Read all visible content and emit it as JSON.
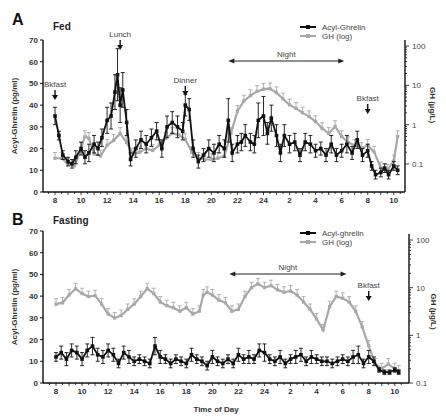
{
  "chart_data": [
    {
      "panel": "A",
      "title": "Fed",
      "type": "line",
      "xlabel": "",
      "ylabel": "Acyl-Ghrelin (pg/ml)",
      "y2label": "GH (µg/L)",
      "ylim": [
        0,
        70
      ],
      "y2lim_log": [
        0.1,
        100
      ],
      "yticks": [
        "0",
        "10",
        "20",
        "30",
        "40",
        "50",
        "60",
        "70"
      ],
      "y2ticks": [
        "0.1",
        "1",
        "10",
        "100"
      ],
      "xticks": [
        "8",
        "10",
        "12",
        "14",
        "16",
        "18",
        "20",
        "22",
        "24",
        "2",
        "4",
        "6",
        "8",
        "10"
      ],
      "legend": [
        {
          "name": "Acyl-Ghrelin",
          "color": "#111111"
        },
        {
          "name": "GH (log)",
          "color": "#a8a8a8"
        }
      ],
      "annotations": [
        {
          "text": "Bkfast",
          "hour": 8
        },
        {
          "text": "Lunch",
          "hour": 13
        },
        {
          "text": "Dinner",
          "hour": 18
        },
        {
          "text": "Bkfast",
          "hour": 32
        }
      ],
      "night": {
        "label": "Night",
        "from": 21.3,
        "to": 30.2
      },
      "series": [
        {
          "name": "Acyl-Ghrelin",
          "hours": [
            8,
            8.3,
            8.6,
            9,
            9.3,
            9.6,
            10,
            10.3,
            10.6,
            11,
            11.3,
            11.6,
            12,
            12.3,
            12.6,
            12.8,
            13,
            13.2,
            13.5,
            13.8,
            14.2,
            14.6,
            15,
            15.4,
            15.8,
            16.2,
            16.6,
            17,
            17.4,
            17.8,
            18,
            18.3,
            18.6,
            19,
            19.4,
            19.8,
            20.2,
            20.6,
            21,
            21.3,
            21.6,
            22,
            22.3,
            22.6,
            23,
            23.3,
            23.6,
            24,
            24.3,
            24.6,
            25,
            25.3,
            25.6,
            26,
            26.4,
            26.8,
            27.2,
            27.6,
            28,
            28.4,
            28.8,
            29.2,
            29.6,
            30,
            30.4,
            30.8,
            31.2,
            31.6,
            32,
            32.3,
            32.6,
            33,
            33.3,
            33.6,
            34,
            34.3
          ],
          "values": [
            35,
            26,
            17,
            14,
            13,
            16,
            20,
            16,
            18,
            22,
            20,
            25,
            33,
            35,
            46,
            54,
            40,
            47,
            32,
            15,
            20,
            24,
            22,
            25,
            28,
            20,
            30,
            32,
            30,
            28,
            40,
            38,
            20,
            14,
            17,
            20,
            18,
            22,
            20,
            33,
            18,
            22,
            23,
            26,
            23,
            22,
            33,
            35,
            27,
            34,
            26,
            18,
            26,
            22,
            23,
            17,
            23,
            22,
            19,
            20,
            17,
            22,
            17,
            19,
            22,
            18,
            24,
            17,
            19,
            12,
            8,
            9,
            11,
            8,
            12,
            10
          ],
          "err": [
            4,
            2,
            2,
            2,
            2,
            3,
            3,
            3,
            4,
            4,
            3,
            4,
            6,
            6,
            8,
            12,
            8,
            8,
            6,
            3,
            4,
            4,
            4,
            4,
            4,
            4,
            5,
            5,
            5,
            4,
            5,
            5,
            4,
            3,
            3,
            4,
            4,
            4,
            4,
            10,
            4,
            4,
            4,
            5,
            4,
            4,
            8,
            9,
            5,
            6,
            5,
            4,
            5,
            4,
            4,
            3,
            4,
            4,
            3,
            3,
            3,
            4,
            3,
            3,
            4,
            3,
            4,
            3,
            3,
            2,
            2,
            2,
            2,
            2,
            2,
            2
          ]
        },
        {
          "name": "GH (log)",
          "hours": [
            8,
            8.5,
            9,
            9.5,
            10,
            10.3,
            10.6,
            11,
            11.5,
            12,
            12.5,
            13,
            13.5,
            14,
            14.5,
            15,
            15.5,
            16,
            16.5,
            17,
            17.5,
            18,
            18.5,
            19,
            19.5,
            20,
            20.5,
            21,
            21.5,
            22,
            22.5,
            23,
            23.5,
            24,
            24.5,
            25,
            25.5,
            26,
            26.5,
            27,
            27.5,
            28,
            28.5,
            29,
            29.5,
            30,
            30.5,
            31,
            31.5,
            32,
            32.5,
            33,
            33.5,
            34,
            34.3
          ],
          "values": [
            0.14,
            0.14,
            0.1,
            0.09,
            0.25,
            0.5,
            0.45,
            0.18,
            0.16,
            0.3,
            0.4,
            0.6,
            0.35,
            0.18,
            0.2,
            0.25,
            0.22,
            0.3,
            0.45,
            0.6,
            0.55,
            0.42,
            0.2,
            0.14,
            0.13,
            0.13,
            0.14,
            0.16,
            0.6,
            2.2,
            4,
            5.5,
            7,
            8,
            8.2,
            6.5,
            4.5,
            3.2,
            2.6,
            2,
            1.6,
            1.2,
            0.8,
            0.6,
            0.9,
            0.5,
            0.35,
            0.3,
            0.25,
            0.3,
            0.2,
            0.08,
            0.07,
            0.12,
            0.5
          ],
          "err_factor": 1.4
        }
      ]
    },
    {
      "panel": "B",
      "title": "Fasting",
      "type": "line",
      "xlabel": "Time of Day",
      "ylabel": "Acyl-Ghrelin (pg/ml)",
      "y2label": "GH (µg/L)",
      "ylim": [
        0,
        70
      ],
      "y2lim_log": [
        0.1,
        100
      ],
      "yticks": [
        "0",
        "10",
        "20",
        "30",
        "40",
        "50",
        "60",
        "70"
      ],
      "y2ticks": [
        "0.1",
        "1",
        "10",
        "100"
      ],
      "xticks": [
        "8",
        "10",
        "12",
        "14",
        "16",
        "18",
        "20",
        "22",
        "24",
        "2",
        "4",
        "6",
        "8",
        "10"
      ],
      "legend": [
        {
          "name": "Acyl-ghrelin",
          "color": "#111111"
        },
        {
          "name": "GH (log)",
          "color": "#a8a8a8"
        }
      ],
      "annotations": [
        {
          "text": "Bkfast",
          "hour": 32
        }
      ],
      "night": {
        "label": "Night",
        "from": 21.3,
        "to": 30.3
      },
      "series": [
        {
          "name": "Acyl-ghrelin",
          "hours": [
            8,
            8.4,
            8.8,
            9.2,
            9.6,
            10,
            10.4,
            10.8,
            11.2,
            11.6,
            12,
            12.4,
            12.8,
            13.2,
            13.6,
            14,
            14.4,
            14.8,
            15.2,
            15.6,
            16,
            16.4,
            16.8,
            17.2,
            17.6,
            18,
            18.4,
            18.8,
            19.2,
            19.6,
            20,
            20.4,
            20.8,
            21.2,
            21.6,
            22,
            22.4,
            22.8,
            23.2,
            23.6,
            24,
            24.4,
            24.8,
            25.2,
            25.6,
            26,
            26.4,
            26.8,
            27.2,
            27.6,
            28,
            28.4,
            28.8,
            29.2,
            29.6,
            30,
            30.4,
            30.8,
            31.2,
            31.6,
            32,
            32.4,
            32.8,
            33.2,
            33.6,
            34,
            34.3
          ],
          "values": [
            12,
            14,
            11,
            15,
            14,
            11,
            15,
            17,
            13,
            12,
            15,
            13,
            9,
            14,
            12,
            10,
            11,
            10,
            9,
            17,
            12,
            11,
            9,
            11,
            10,
            9,
            13,
            11,
            10,
            8,
            12,
            10,
            9,
            11,
            9,
            13,
            11,
            12,
            11,
            15,
            14,
            11,
            10,
            12,
            9,
            11,
            12,
            13,
            10,
            12,
            11,
            10,
            10,
            9,
            10,
            11,
            10,
            12,
            13,
            9,
            12,
            10,
            6,
            5,
            5,
            6,
            5
          ],
          "err": [
            2,
            3,
            3,
            3,
            3,
            3,
            3,
            4,
            3,
            3,
            3,
            3,
            2,
            3,
            3,
            2,
            2,
            2,
            2,
            4,
            3,
            2,
            2,
            2,
            2,
            2,
            3,
            2,
            2,
            2,
            3,
            2,
            2,
            2,
            2,
            3,
            2,
            3,
            2,
            3,
            4,
            2,
            2,
            3,
            2,
            2,
            3,
            3,
            2,
            3,
            2,
            2,
            2,
            2,
            2,
            2,
            2,
            3,
            4,
            2,
            3,
            2,
            1,
            1,
            1,
            1,
            1
          ]
        },
        {
          "name": "GH (log)",
          "hours": [
            8,
            8.5,
            9,
            9.5,
            10,
            10.5,
            11,
            11.5,
            12,
            12.5,
            13,
            13.5,
            14,
            14.5,
            15,
            15.5,
            16,
            16.5,
            17,
            17.5,
            18,
            18.5,
            19,
            19.3,
            19.6,
            20,
            20.5,
            21,
            21.5,
            22,
            22.5,
            23,
            23.5,
            24,
            24.5,
            25,
            25.5,
            26,
            26.5,
            27,
            27.5,
            28,
            28.5,
            29,
            29.5,
            30,
            30.5,
            31,
            31.5,
            32,
            32.5,
            33,
            33.5,
            34,
            34.3
          ],
          "values": [
            4.5,
            4.8,
            7,
            9.5,
            7.5,
            6.5,
            6.8,
            4.5,
            2.8,
            2.3,
            2.6,
            3.5,
            4.5,
            6.5,
            9.5,
            7.5,
            5,
            4.2,
            3.8,
            3.2,
            3.8,
            2.8,
            3.2,
            7,
            8,
            7,
            5.5,
            4.8,
            3.2,
            3.5,
            6.5,
            10,
            12,
            10,
            11,
            9,
            8,
            8.5,
            7,
            5,
            3.5,
            2.2,
            1.3,
            4,
            6.5,
            6,
            5,
            3.2,
            1.5,
            0.6,
            0.25,
            0.2,
            0.25,
            0.2,
            0.18
          ],
          "err_factor": 1.3
        }
      ]
    }
  ],
  "panels": {
    "A": {
      "letter": "A",
      "title": "Fed"
    },
    "B": {
      "letter": "B",
      "title": "Fasting"
    }
  }
}
